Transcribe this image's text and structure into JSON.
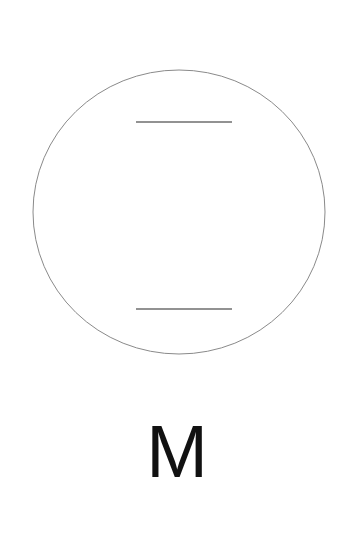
{
  "figure": {
    "type": "schematic-drawing",
    "background_color": "#ffffff",
    "circle": {
      "name": "circle-outline",
      "center_x": 179,
      "center_y": 212,
      "radius_x": 146,
      "radius_y": 142,
      "stroke_color": "#8a8a8a",
      "stroke_width": 1,
      "fill": "none"
    },
    "lines": [
      {
        "name": "upper-horizontal-line",
        "x1": 136,
        "y1": 122,
        "x2": 232,
        "y2": 122,
        "stroke_color": "#6e6e6e",
        "stroke_width": 1.4
      },
      {
        "name": "lower-horizontal-line",
        "x1": 136,
        "y1": 309,
        "x2": 232,
        "y2": 309,
        "stroke_color": "#6e6e6e",
        "stroke_width": 1.4
      }
    ]
  },
  "caption": {
    "label": "M",
    "color": "#111111"
  }
}
